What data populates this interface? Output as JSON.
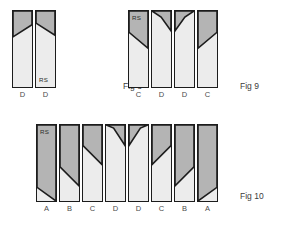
{
  "document": {
    "title": "Roof Slope Rafter Cutting Diagram",
    "background_color": "#ffffff"
  },
  "palette": {
    "light_fill": "#ececec",
    "dark_fill": "#b4b4b4",
    "outline": "#1c1c1c",
    "label_text": "#4a4a4a",
    "caption_text": "#3c3c3c"
  },
  "figures": [
    {
      "id": "fig-8",
      "caption": "Fig 8",
      "caption_x": 123,
      "caption_y": 82,
      "row_x": 12,
      "row_y": 10,
      "bar_width": 21,
      "bar_height": 78,
      "bar_gap": 2,
      "bars": [
        {
          "label": "D",
          "rs_tag": "",
          "rs_position": "",
          "shape": "dark-wedge-top-left-descending",
          "polygon": "0,0 100,0 100,18 0,34",
          "polygon_note": "dark triangle across top, diagonal falls left-to-right"
        },
        {
          "label": "D",
          "rs_tag": "RS",
          "rs_position": "bottom",
          "shape": "dark-wedge-top-right-ascending",
          "polygon": "0,0 100,0 100,32 0,16",
          "polygon_note": "dark triangle across top, diagonal rises left-to-right"
        }
      ]
    },
    {
      "id": "fig-9",
      "caption": "Fig 9",
      "caption_x": 240,
      "caption_y": 82,
      "row_x": 128,
      "row_y": 10,
      "bar_width": 21,
      "bar_height": 78,
      "bar_gap": 2,
      "bars": [
        {
          "label": "C",
          "rs_tag": "RS",
          "rs_position": "top",
          "shape": "dark-upper-diagonal-descending",
          "polygon": "0,0 100,0 100,49 0,28",
          "polygon_note": "large dark upper block, diagonal falls left-to-right"
        },
        {
          "label": "D",
          "rs_tag": "",
          "rs_position": "",
          "shape": "dark-triangle-top-right-notch",
          "polygon": "0,0 100,0 100,26 48,8",
          "polygon_note": "small dark wedge at top-right of bar"
        },
        {
          "label": "D",
          "rs_tag": "",
          "rs_position": "",
          "shape": "dark-triangle-top-left-notch",
          "polygon": "0,0 100,0 52,8 0,26",
          "polygon_note": "small dark wedge at top-left of bar"
        },
        {
          "label": "C",
          "rs_tag": "",
          "rs_position": "",
          "shape": "dark-upper-diagonal-ascending",
          "polygon": "0,0 100,0 100,28 0,49",
          "polygon_note": "large dark upper block, diagonal rises left-to-right"
        }
      ]
    },
    {
      "id": "fig-10",
      "caption": "Fig 10",
      "caption_x": 240,
      "caption_y": 192,
      "row_x": 36,
      "row_y": 124,
      "bar_width": 21,
      "bar_height": 78,
      "bar_gap": 2,
      "bars": [
        {
          "label": "A",
          "rs_tag": "RS",
          "rs_position": "top",
          "shape": "dark-body-diagonal-low-descending",
          "polygon": "0,0 100,0 100,100 0,82",
          "polygon_note": "dark nearly-full bar, diagonal falls near bottom"
        },
        {
          "label": "B",
          "rs_tag": "",
          "rs_position": "",
          "shape": "dark-body-diagonal-mid-descending",
          "polygon": "0,0 100,0 100,80 0,55",
          "polygon_note": "dark upper two-thirds, diagonal falls left-to-right"
        },
        {
          "label": "C",
          "rs_tag": "",
          "rs_position": "",
          "shape": "dark-body-diagonal-upper-descending",
          "polygon": "0,0 100,0 100,52 0,27",
          "polygon_note": "dark upper third, diagonal falls left-to-right"
        },
        {
          "label": "D",
          "rs_tag": "",
          "rs_position": "",
          "shape": "dark-triangle-top-right-notch",
          "polygon": "0,0 100,0 100,27 40,4",
          "polygon_note": "small dark wedge at top-right"
        },
        {
          "label": "D",
          "rs_tag": "",
          "rs_position": "",
          "shape": "dark-triangle-top-left-notch",
          "polygon": "0,0 100,0 60,4 0,27",
          "polygon_note": "small dark wedge at top-left"
        },
        {
          "label": "C",
          "rs_tag": "",
          "rs_position": "",
          "shape": "dark-body-diagonal-upper-ascending",
          "polygon": "0,0 100,0 100,27 0,52",
          "polygon_note": "dark upper third, diagonal rises left-to-right"
        },
        {
          "label": "B",
          "rs_tag": "",
          "rs_position": "",
          "shape": "dark-body-diagonal-mid-ascending",
          "polygon": "0,0 100,0 100,55 0,80",
          "polygon_note": "dark upper two-thirds, diagonal rises left-to-right"
        },
        {
          "label": "A",
          "rs_tag": "",
          "rs_position": "",
          "shape": "dark-body-diagonal-low-ascending",
          "polygon": "0,0 100,0 100,82 0,100",
          "polygon_note": "dark nearly-full bar, diagonal rises near bottom"
        }
      ]
    }
  ]
}
